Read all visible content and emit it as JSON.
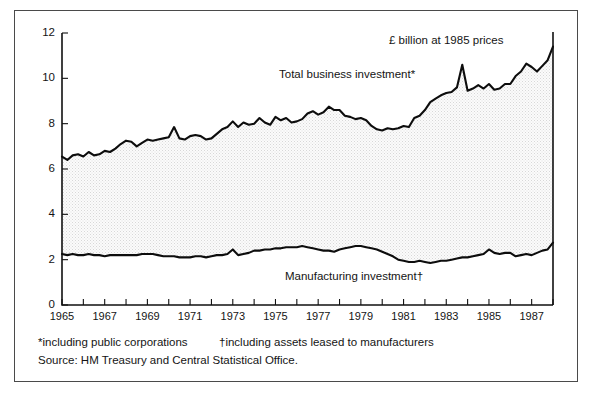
{
  "chart_data": {
    "type": "area",
    "title": "£ billion at 1985 prices",
    "xlabel": "",
    "ylabel": "",
    "xlim": [
      1965,
      1988
    ],
    "ylim": [
      0,
      12
    ],
    "yticks": [
      "0",
      "2",
      "4",
      "6",
      "8",
      "10",
      "12"
    ],
    "xticks": [
      "1965",
      "1967",
      "1969",
      "1971",
      "1973",
      "1975",
      "1977",
      "1979",
      "1981",
      "1983",
      "1985",
      "1987"
    ],
    "xtick_minor_step_years": 1,
    "grid": false,
    "legend": "inline-annotations",
    "annotations": [
      {
        "name": "units-note",
        "text": "£ billion at 1985 prices"
      },
      {
        "name": "total-label",
        "text": "Total business investment*"
      },
      {
        "name": "manufacturing-label",
        "text": "Manufacturing investment†"
      }
    ],
    "series": [
      {
        "name": "Total business investment*",
        "x": [
          1965.0,
          1965.25,
          1965.5,
          1965.75,
          1966.0,
          1966.25,
          1966.5,
          1966.75,
          1967.0,
          1967.25,
          1967.5,
          1967.75,
          1968.0,
          1968.25,
          1968.5,
          1968.75,
          1969.0,
          1969.25,
          1969.5,
          1969.75,
          1970.0,
          1970.25,
          1970.5,
          1970.75,
          1971.0,
          1971.25,
          1971.5,
          1971.75,
          1972.0,
          1972.25,
          1972.5,
          1972.75,
          1973.0,
          1973.25,
          1973.5,
          1973.75,
          1974.0,
          1974.25,
          1974.5,
          1974.75,
          1975.0,
          1975.25,
          1975.5,
          1975.75,
          1976.0,
          1976.25,
          1976.5,
          1976.75,
          1977.0,
          1977.25,
          1977.5,
          1977.75,
          1978.0,
          1978.25,
          1978.5,
          1978.75,
          1979.0,
          1979.25,
          1979.5,
          1979.75,
          1980.0,
          1980.25,
          1980.5,
          1980.75,
          1981.0,
          1981.25,
          1981.5,
          1981.75,
          1982.0,
          1982.25,
          1982.5,
          1982.75,
          1983.0,
          1983.25,
          1983.5,
          1983.75,
          1984.0,
          1984.25,
          1984.5,
          1984.75,
          1985.0,
          1985.25,
          1985.5,
          1985.75,
          1986.0,
          1986.25,
          1986.5,
          1986.75,
          1987.0,
          1987.25,
          1987.5,
          1987.75,
          1988.0
        ],
        "y": [
          6.55,
          6.4,
          6.6,
          6.65,
          6.55,
          6.75,
          6.6,
          6.65,
          6.8,
          6.75,
          6.9,
          7.1,
          7.25,
          7.2,
          7.0,
          7.15,
          7.3,
          7.25,
          7.3,
          7.35,
          7.4,
          7.85,
          7.35,
          7.3,
          7.45,
          7.5,
          7.45,
          7.3,
          7.35,
          7.55,
          7.75,
          7.85,
          8.1,
          7.85,
          8.05,
          7.95,
          8.0,
          8.25,
          8.05,
          7.95,
          8.3,
          8.15,
          8.25,
          8.05,
          8.1,
          8.2,
          8.45,
          8.55,
          8.4,
          8.5,
          8.75,
          8.6,
          8.6,
          8.35,
          8.3,
          8.2,
          8.25,
          8.15,
          7.9,
          7.75,
          7.7,
          7.8,
          7.75,
          7.8,
          7.9,
          7.85,
          8.25,
          8.35,
          8.6,
          8.95,
          9.1,
          9.25,
          9.35,
          9.4,
          9.6,
          10.6,
          9.45,
          9.55,
          9.7,
          9.55,
          9.75,
          9.5,
          9.55,
          9.75,
          9.75,
          10.1,
          10.3,
          10.65,
          10.5,
          10.3,
          10.55,
          10.8,
          11.4
        ]
      },
      {
        "name": "Manufacturing investment†",
        "x": [
          1965.0,
          1965.25,
          1965.5,
          1965.75,
          1966.0,
          1966.25,
          1966.5,
          1966.75,
          1967.0,
          1967.25,
          1967.5,
          1967.75,
          1968.0,
          1968.25,
          1968.5,
          1968.75,
          1969.0,
          1969.25,
          1969.5,
          1969.75,
          1970.0,
          1970.25,
          1970.5,
          1970.75,
          1971.0,
          1971.25,
          1971.5,
          1971.75,
          1972.0,
          1972.25,
          1972.5,
          1972.75,
          1973.0,
          1973.25,
          1973.5,
          1973.75,
          1974.0,
          1974.25,
          1974.5,
          1974.75,
          1975.0,
          1975.25,
          1975.5,
          1975.75,
          1976.0,
          1976.25,
          1976.5,
          1976.75,
          1977.0,
          1977.25,
          1977.5,
          1977.75,
          1978.0,
          1978.25,
          1978.5,
          1978.75,
          1979.0,
          1979.25,
          1979.5,
          1979.75,
          1980.0,
          1980.25,
          1980.5,
          1980.75,
          1981.0,
          1981.25,
          1981.5,
          1981.75,
          1982.0,
          1982.25,
          1982.5,
          1982.75,
          1983.0,
          1983.25,
          1983.5,
          1983.75,
          1984.0,
          1984.25,
          1984.5,
          1984.75,
          1985.0,
          1985.25,
          1985.5,
          1985.75,
          1986.0,
          1986.25,
          1986.5,
          1986.75,
          1987.0,
          1987.25,
          1987.5,
          1987.75,
          1988.0
        ],
        "y": [
          2.25,
          2.2,
          2.25,
          2.2,
          2.2,
          2.25,
          2.2,
          2.2,
          2.15,
          2.2,
          2.2,
          2.2,
          2.2,
          2.2,
          2.2,
          2.25,
          2.25,
          2.25,
          2.2,
          2.15,
          2.15,
          2.15,
          2.1,
          2.1,
          2.1,
          2.15,
          2.15,
          2.1,
          2.15,
          2.2,
          2.2,
          2.25,
          2.45,
          2.2,
          2.25,
          2.3,
          2.4,
          2.4,
          2.45,
          2.45,
          2.5,
          2.5,
          2.55,
          2.55,
          2.55,
          2.6,
          2.55,
          2.5,
          2.45,
          2.4,
          2.4,
          2.35,
          2.45,
          2.5,
          2.55,
          2.6,
          2.6,
          2.55,
          2.5,
          2.45,
          2.35,
          2.25,
          2.15,
          2.0,
          1.95,
          1.9,
          1.9,
          1.95,
          1.9,
          1.85,
          1.9,
          1.95,
          1.95,
          2.0,
          2.05,
          2.1,
          2.1,
          2.15,
          2.2,
          2.25,
          2.45,
          2.3,
          2.25,
          2.3,
          2.3,
          2.15,
          2.2,
          2.25,
          2.2,
          2.3,
          2.4,
          2.45,
          2.75
        ]
      }
    ]
  },
  "footnotes": {
    "line1_left": "*including public corporations",
    "line1_right": "†including assets leased to manufacturers",
    "line2": "Source: HM Treasury and Central Statistical Office."
  },
  "colors": {
    "line": "#0d0d0d",
    "frame": "#4a4a4a",
    "fill": "#f0f0f0",
    "text": "#141414",
    "background": "#ffffff"
  }
}
